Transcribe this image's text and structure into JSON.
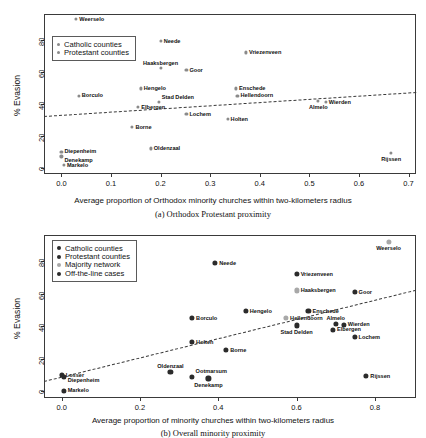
{
  "chart_data": [
    {
      "id": "panel-a",
      "type": "scatter",
      "title": "",
      "caption": "(a) Orthodox Protestant proximity",
      "xlabel": "Average proportion of Orthodox minority churches within two-kilometers radius",
      "ylabel": "% Evasion",
      "xlim": [
        -0.035,
        0.715
      ],
      "ylim": [
        -4,
        96
      ],
      "xticks": [
        "0.0",
        "0.1",
        "0.2",
        "0.3",
        "0.4",
        "0.5",
        "0.6",
        "0.7"
      ],
      "xtickvals": [
        0.0,
        0.1,
        0.2,
        0.3,
        0.4,
        0.5,
        0.6,
        0.7
      ],
      "yticks": [
        "0",
        "20",
        "40",
        "60",
        "80"
      ],
      "ytickvals": [
        0,
        20,
        40,
        60,
        80
      ],
      "grid": false,
      "legend": {
        "position": "top-left",
        "entries": [
          {
            "label": "Catholic counties",
            "color": "#8a8a8a"
          },
          {
            "label": "Protestant counties",
            "color": "#8a8a8a"
          }
        ]
      },
      "trendline": {
        "x0": -0.035,
        "y0": 32.5,
        "x1": 0.715,
        "y1": 47.5,
        "style": "dashed"
      },
      "points": [
        {
          "name": "Weerselo",
          "x": 0.03,
          "y": 93.0,
          "group": "catholic",
          "label_pos": "right"
        },
        {
          "name": "Neede",
          "x": 0.2,
          "y": 79.0,
          "group": "protestant",
          "label_pos": "right"
        },
        {
          "name": "Vriezenveen",
          "x": 0.372,
          "y": 72.0,
          "group": "protestant",
          "label_pos": "right"
        },
        {
          "name": "Haaksbergen",
          "x": 0.2,
          "y": 62.5,
          "group": "catholic",
          "label_pos": "above"
        },
        {
          "name": "Goor",
          "x": 0.252,
          "y": 61.0,
          "group": "protestant",
          "label_pos": "right"
        },
        {
          "name": "Hengelo",
          "x": 0.16,
          "y": 49.5,
          "group": "catholic",
          "label_pos": "right"
        },
        {
          "name": "Enschede",
          "x": 0.352,
          "y": 49.5,
          "group": "catholic",
          "label_pos": "right"
        },
        {
          "name": "Hellendoorn",
          "x": 0.355,
          "y": 45.0,
          "group": "protestant",
          "label_pos": "right"
        },
        {
          "name": "Borculo",
          "x": 0.035,
          "y": 45.0,
          "group": "protestant",
          "label_pos": "right"
        },
        {
          "name": "Stad Delden",
          "x": 0.197,
          "y": 41.0,
          "group": "catholic",
          "label_pos": "above-right"
        },
        {
          "name": "Wierden",
          "x": 0.533,
          "y": 41.0,
          "group": "protestant",
          "label_pos": "right"
        },
        {
          "name": "Almelo",
          "x": 0.518,
          "y": 41.5,
          "group": "protestant",
          "label_pos": "below"
        },
        {
          "name": "Elbergen",
          "x": 0.155,
          "y": 38.0,
          "group": "catholic",
          "label_pos": "right"
        },
        {
          "name": "Lochem",
          "x": 0.252,
          "y": 33.5,
          "group": "protestant",
          "label_pos": "right"
        },
        {
          "name": "Holten",
          "x": 0.335,
          "y": 30.5,
          "group": "protestant",
          "label_pos": "right"
        },
        {
          "name": "Borne",
          "x": 0.143,
          "y": 25.5,
          "group": "catholic",
          "label_pos": "right"
        },
        {
          "name": "Oldenzaal",
          "x": 0.18,
          "y": 12.0,
          "group": "catholic",
          "label_pos": "right"
        },
        {
          "name": "Diepenheim",
          "x": 0.0,
          "y": 10.0,
          "group": "protestant",
          "label_pos": "right"
        },
        {
          "name": "Denekamp",
          "x": 0.0,
          "y": 7.0,
          "group": "catholic",
          "label_pos": "right-low"
        },
        {
          "name": "Rijssen",
          "x": 0.665,
          "y": 9.0,
          "group": "protestant",
          "label_pos": "below"
        },
        {
          "name": "Markelo",
          "x": 0.005,
          "y": 1.5,
          "group": "protestant",
          "label_pos": "right"
        }
      ]
    },
    {
      "id": "panel-b",
      "type": "scatter",
      "title": "",
      "caption": "(b) Overall minority proximity",
      "xlabel": "Average proportion of minority churches within two-kilometers radius",
      "ylabel": "% Evasion",
      "xlim": [
        -0.045,
        0.905
      ],
      "ylim": [
        -4,
        96
      ],
      "xticks": [
        "0.0",
        "0.2",
        "0.4",
        "0.6",
        "0.8"
      ],
      "xtickvals": [
        0.0,
        0.2,
        0.4,
        0.6,
        0.8
      ],
      "yticks": [
        "0",
        "20",
        "40",
        "60",
        "80"
      ],
      "ytickvals": [
        0,
        20,
        40,
        60,
        80
      ],
      "grid": false,
      "legend": {
        "position": "top-left",
        "entries": [
          {
            "label": "Catholic counties",
            "color": "#2b2b2b"
          },
          {
            "label": "Protestant counties",
            "color": "#2b2b2b"
          },
          {
            "label": "Majority network",
            "color": "#a8a8a8"
          },
          {
            "label": "Off-the-line cases",
            "color": "#2b2b2b"
          }
        ]
      },
      "trendline": {
        "x0": -0.045,
        "y0": 6.5,
        "x1": 0.905,
        "y1": 62.5,
        "style": "dashed"
      },
      "points": [
        {
          "name": "Weerselo",
          "x": 0.835,
          "y": 92.0,
          "group": "majority",
          "label_pos": "below"
        },
        {
          "name": "Neede",
          "x": 0.392,
          "y": 79.0,
          "group": "dark",
          "label_pos": "right"
        },
        {
          "name": "Vriezenveen",
          "x": 0.6,
          "y": 72.0,
          "group": "dark",
          "label_pos": "right"
        },
        {
          "name": "Haaksbergen",
          "x": 0.6,
          "y": 62.0,
          "group": "majority",
          "label_pos": "right"
        },
        {
          "name": "Goor",
          "x": 0.748,
          "y": 61.0,
          "group": "dark",
          "label_pos": "right"
        },
        {
          "name": "Hengelo",
          "x": 0.47,
          "y": 49.5,
          "group": "dark",
          "label_pos": "right"
        },
        {
          "name": "Enschede",
          "x": 0.63,
          "y": 49.5,
          "group": "dark",
          "label_pos": "right"
        },
        {
          "name": "Borculo",
          "x": 0.333,
          "y": 45.0,
          "group": "dark",
          "label_pos": "right"
        },
        {
          "name": "Hellendoorn",
          "x": 0.573,
          "y": 45.0,
          "group": "majority",
          "label_pos": "right"
        },
        {
          "name": "Almelo",
          "x": 0.7,
          "y": 41.5,
          "group": "dark",
          "label_pos": "above"
        },
        {
          "name": "Wierden",
          "x": 0.72,
          "y": 41.0,
          "group": "dark",
          "label_pos": "right"
        },
        {
          "name": "Stad Delden",
          "x": 0.6,
          "y": 40.5,
          "group": "dark",
          "label_pos": "below"
        },
        {
          "name": "Elbergen",
          "x": 0.693,
          "y": 38.0,
          "group": "dark",
          "label_pos": "right"
        },
        {
          "name": "Lochem",
          "x": 0.748,
          "y": 33.5,
          "group": "dark",
          "label_pos": "right"
        },
        {
          "name": "Holten",
          "x": 0.333,
          "y": 30.5,
          "group": "dark",
          "label_pos": "right"
        },
        {
          "name": "Borne",
          "x": 0.42,
          "y": 25.5,
          "group": "dark",
          "label_pos": "right"
        },
        {
          "name": "Oldenzaal",
          "x": 0.278,
          "y": 12.0,
          "group": "dark",
          "label_pos": "above"
        },
        {
          "name": "Losser",
          "x": 0.0,
          "y": 10.0,
          "group": "dark",
          "label_pos": "right"
        },
        {
          "name": "Diepenheim",
          "x": 0.005,
          "y": 9.0,
          "group": "dark",
          "label_pos": "right-low"
        },
        {
          "name": "Ootmarsum",
          "x": 0.333,
          "y": 9.0,
          "group": "dark",
          "label_pos": "above-right"
        },
        {
          "name": "Denekamp",
          "x": 0.375,
          "y": 8.0,
          "group": "dark",
          "label_pos": "below"
        },
        {
          "name": "Rijssen",
          "x": 0.778,
          "y": 9.5,
          "group": "dark",
          "label_pos": "right"
        },
        {
          "name": "Markelo",
          "x": 0.005,
          "y": 0.5,
          "group": "dark",
          "label_pos": "right"
        }
      ]
    }
  ]
}
